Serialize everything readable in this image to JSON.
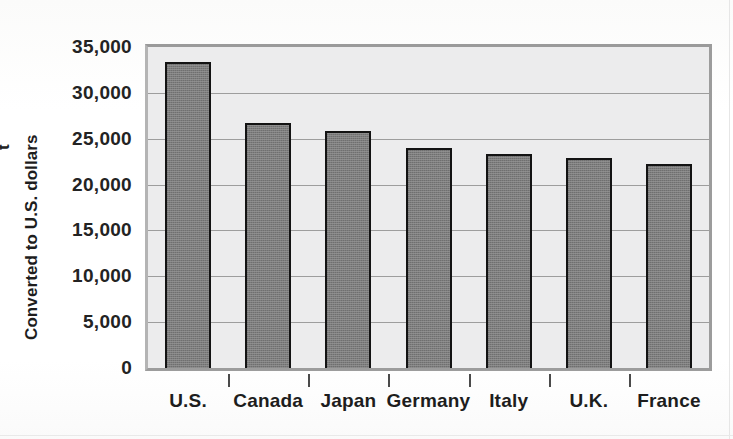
{
  "chart_data": {
    "type": "bar",
    "title": "",
    "subtitle": "",
    "xlabel": "",
    "ylabel": "Converted to U.S. dollars",
    "categories": [
      "U.S.",
      "Canada",
      "Japan",
      "Germany",
      "Italy",
      "U.K.",
      "France"
    ],
    "values": [
      33400,
      26700,
      25800,
      24000,
      23300,
      22900,
      22200
    ],
    "ylim": [
      0,
      35000
    ],
    "ytick_values": [
      0,
      5000,
      10000,
      15000,
      20000,
      25000,
      30000,
      35000
    ],
    "ytick_labels": [
      "0",
      "5,000",
      "10,000",
      "15,000",
      "20,000",
      "25,000",
      "30,000",
      "35,000"
    ],
    "grid": true,
    "legend": null,
    "legend_position": "none",
    "series": [
      {
        "name": "Converted to U.S. dollars",
        "values": [
          33400,
          26700,
          25800,
          24000,
          23300,
          22900,
          22200
        ]
      }
    ],
    "bar_color": "#7d7d7d",
    "bar_edge_color": "#131313",
    "plot_background": "#ececed",
    "grid_color": "#9d9d9d",
    "frame_color": "#9c9c9c",
    "text_color": "#1d1d1d"
  },
  "clipped_text": "t",
  "page": {
    "background": "#fdfdfd"
  }
}
